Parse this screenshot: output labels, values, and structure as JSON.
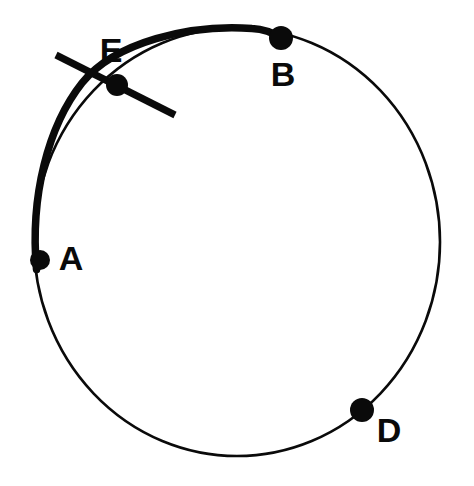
{
  "figure": {
    "type": "circle-geometry-diagram",
    "background_color": "#ffffff",
    "stroke_color": "#0a0a0a",
    "canvas": {
      "width": 474,
      "height": 486
    },
    "circle": {
      "center_x": 237,
      "center_y": 242,
      "radius_x": 203,
      "radius_y": 214,
      "thin_stroke_width": 2.6,
      "thick_stroke_width": 7.5
    },
    "highlighted_arc": {
      "name": "arc-A-E-B",
      "from_label": "A",
      "through_label": "E",
      "to_label": "B",
      "path": "M 36.5 269.5 C 30 196 48 126 82 83 C 115 42 190 24 252 28.5 C 262 29 272 32 281 38"
    },
    "secant_line": {
      "name": "line-through-E",
      "x1": 56,
      "y1": 55,
      "x2": 175,
      "y2": 115,
      "stroke_width": 7
    },
    "points": [
      {
        "label": "A",
        "cx": 40,
        "cy": 260,
        "r": 10,
        "label_x": 71,
        "label_y": 261
      },
      {
        "label": "B",
        "cx": 281,
        "cy": 38,
        "r": 12,
        "label_x": 283,
        "label_y": 77
      },
      {
        "label": "D",
        "cx": 362,
        "cy": 410,
        "r": 12,
        "label_x": 389,
        "label_y": 433
      },
      {
        "label": "E",
        "cx": 117,
        "cy": 85,
        "r": 11,
        "label_x": 111,
        "label_y": 53
      }
    ]
  }
}
